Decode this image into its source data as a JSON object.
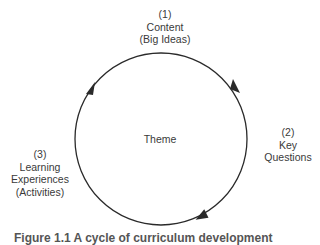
{
  "diagram": {
    "center_label": "Theme",
    "nodes": [
      {
        "number": "(1)",
        "lines": [
          "Content",
          "(Big Ideas)"
        ]
      },
      {
        "number": "(2)",
        "lines": [
          "Key",
          "Questions"
        ]
      },
      {
        "number": "(3)",
        "lines": [
          "Learning",
          "Experiences",
          "(Activities)"
        ]
      }
    ],
    "cycle_direction": "clockwise",
    "colors": {
      "stroke": "#2a2a2a",
      "text": "#3a3a3a",
      "background": "#ffffff"
    }
  },
  "caption": "Figure 1.1  A cycle of curriculum development"
}
